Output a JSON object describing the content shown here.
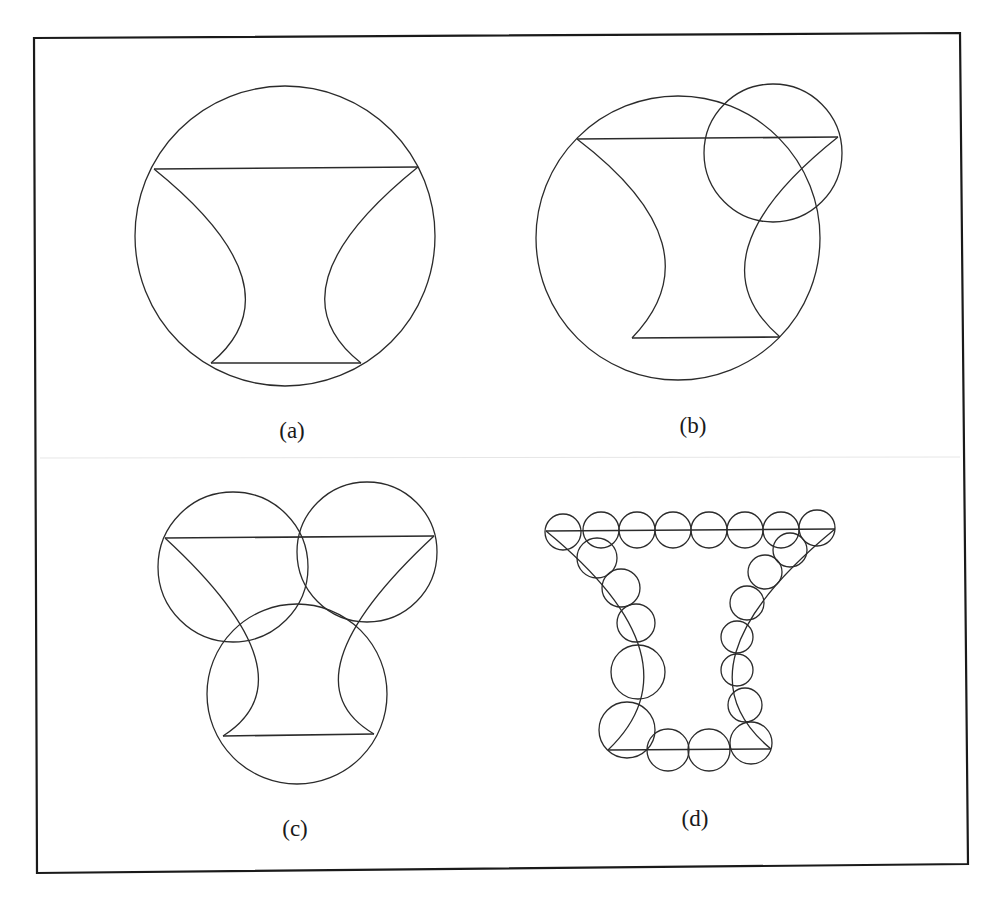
{
  "figure": {
    "frame": {
      "points": [
        [
          34,
          38
        ],
        [
          960,
          33
        ],
        [
          968,
          864
        ],
        [
          37,
          873
        ]
      ],
      "stroke": "#1a1a1a",
      "stroke_width": 2.2
    },
    "bleed_line": {
      "x1": 40,
      "y1": 458,
      "x2": 960,
      "y2": 457,
      "stroke": "#e6e6e6"
    },
    "ink_color": "#2b2b2b",
    "label_font_size": 23,
    "panels": [
      {
        "id": "a",
        "label": "(a)",
        "label_pos": [
          292,
          438
        ],
        "shape": {
          "top_line": [
            [
              154,
              169
            ],
            [
              418,
              167
            ]
          ],
          "bottom_line": [
            [
              211,
              363
            ],
            [
              361,
              363
            ]
          ],
          "left_arc": [
            [
              154,
              169
            ],
            [
              242,
              277
            ],
            [
              211,
              363
            ]
          ],
          "right_arc": [
            [
              418,
              167
            ],
            [
              328,
              277
            ],
            [
              361,
              363
            ]
          ]
        },
        "circles": [
          {
            "cx": 285,
            "cy": 236,
            "r": 150
          }
        ]
      },
      {
        "id": "b",
        "label": "(b)",
        "label_pos": [
          693,
          433
        ],
        "shape": {
          "top_line": [
            [
              577,
              139
            ],
            [
              838,
              137
            ]
          ],
          "bottom_line": [
            [
              632,
              338
            ],
            [
              780,
              337
            ]
          ],
          "left_arc": [
            [
              577,
              139
            ],
            [
              662,
              243
            ],
            [
              632,
              338
            ]
          ],
          "right_arc": [
            [
              838,
              137
            ],
            [
              748,
              247
            ],
            [
              780,
              337
            ]
          ]
        },
        "circles": [
          {
            "cx": 678,
            "cy": 238,
            "r": 142
          },
          {
            "cx": 773,
            "cy": 153,
            "r": 69
          }
        ]
      },
      {
        "id": "c",
        "label": "(c)",
        "label_pos": [
          295,
          836
        ],
        "shape": {
          "top_line": [
            [
              165,
              538
            ],
            [
              434,
              536
            ]
          ],
          "bottom_line": [
            [
              223,
              736
            ],
            [
              374,
              734
            ]
          ],
          "left_arc": [
            [
              165,
              538
            ],
            [
              255,
              657
            ],
            [
              223,
              736
            ]
          ],
          "right_arc": [
            [
              434,
              536
            ],
            [
              342,
              657
            ],
            [
              374,
              734
            ]
          ]
        },
        "circles": [
          {
            "cx": 233,
            "cy": 567,
            "r": 75
          },
          {
            "cx": 367,
            "cy": 552,
            "r": 70
          },
          {
            "cx": 297,
            "cy": 694,
            "r": 90
          }
        ]
      },
      {
        "id": "d",
        "label": "(d)",
        "label_pos": [
          695,
          826
        ],
        "shape": {
          "top_line": [
            [
              546,
              531
            ],
            [
              835,
              529
            ]
          ],
          "bottom_line": [
            [
              608,
              750
            ],
            [
              771,
              749
            ]
          ],
          "left_arc": [
            [
              546,
              531
            ],
            [
              640,
              650
            ],
            [
              608,
              750
            ]
          ],
          "right_arc": [
            [
              835,
              529
            ],
            [
              736,
              652
            ],
            [
              771,
              749
            ]
          ]
        },
        "circles": [
          {
            "cx": 563,
            "cy": 532,
            "r": 18
          },
          {
            "cx": 601,
            "cy": 530,
            "r": 18
          },
          {
            "cx": 637,
            "cy": 530,
            "r": 18
          },
          {
            "cx": 673,
            "cy": 530,
            "r": 18
          },
          {
            "cx": 709,
            "cy": 530,
            "r": 18
          },
          {
            "cx": 745,
            "cy": 530,
            "r": 18
          },
          {
            "cx": 781,
            "cy": 530,
            "r": 18
          },
          {
            "cx": 817,
            "cy": 528,
            "r": 18
          },
          {
            "cx": 597,
            "cy": 558,
            "r": 20
          },
          {
            "cx": 621,
            "cy": 588,
            "r": 19
          },
          {
            "cx": 636,
            "cy": 623,
            "r": 19
          },
          {
            "cx": 638,
            "cy": 672,
            "r": 27
          },
          {
            "cx": 627,
            "cy": 730,
            "r": 28
          },
          {
            "cx": 668,
            "cy": 750,
            "r": 21
          },
          {
            "cx": 709,
            "cy": 750,
            "r": 21
          },
          {
            "cx": 751,
            "cy": 743,
            "r": 21
          },
          {
            "cx": 790,
            "cy": 550,
            "r": 17
          },
          {
            "cx": 765,
            "cy": 572,
            "r": 17
          },
          {
            "cx": 747,
            "cy": 603,
            "r": 17
          },
          {
            "cx": 737,
            "cy": 637,
            "r": 16
          },
          {
            "cx": 737,
            "cy": 670,
            "r": 16
          },
          {
            "cx": 745,
            "cy": 705,
            "r": 17
          }
        ]
      }
    ]
  }
}
